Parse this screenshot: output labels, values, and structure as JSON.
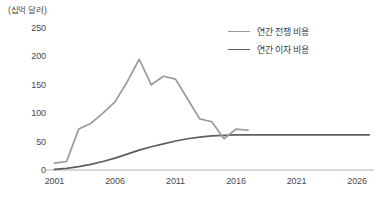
{
  "chart_data": {
    "type": "line",
    "title": "",
    "unit_label": "(십억 달러)",
    "xlabel": "",
    "ylabel": "",
    "xlim": [
      2000.3,
      2027.4
    ],
    "ylim": [
      0,
      250
    ],
    "grid": false,
    "legend_position": "top-right",
    "x_ticks": [
      "2001",
      "2006",
      "2011",
      "2016",
      "2021",
      "2026"
    ],
    "x_tick_values": [
      2001,
      2006,
      2011,
      2016,
      2021,
      2026
    ],
    "y_ticks": [
      "0",
      "50",
      "100",
      "150",
      "200",
      "250"
    ],
    "y_tick_values": [
      0,
      50,
      100,
      150,
      200,
      250
    ],
    "series": [
      {
        "name": "연간 전쟁 비용",
        "color": "#9a9a9a",
        "x": [
          2001,
          2002,
          2003,
          2004,
          2005,
          2006,
          2007,
          2008,
          2009,
          2010,
          2011,
          2012,
          2013,
          2014,
          2015,
          2016,
          2017
        ],
        "values": [
          12,
          15,
          72,
          82,
          100,
          120,
          155,
          195,
          150,
          165,
          160,
          125,
          90,
          85,
          55,
          72,
          70
        ]
      },
      {
        "name": "연간 이자 비용",
        "color": "#5e5e5e",
        "x": [
          2001,
          2002,
          2003,
          2004,
          2005,
          2006,
          2007,
          2008,
          2009,
          2010,
          2011,
          2012,
          2013,
          2014,
          2015,
          2016,
          2017,
          2018,
          2019,
          2020,
          2021,
          2022,
          2023,
          2024,
          2025,
          2026,
          2027
        ],
        "values": [
          1,
          3,
          6,
          10,
          15,
          21,
          28,
          35,
          41,
          46,
          51,
          55,
          58,
          60,
          61,
          62,
          62,
          62,
          62,
          62,
          62,
          62,
          62,
          62,
          62,
          62,
          62
        ]
      }
    ],
    "axis_color": "#b0b0b0"
  },
  "legend": {
    "items": [
      {
        "label": "연간 전쟁 비용",
        "color": "#9a9a9a"
      },
      {
        "label": "연간 이자 비용",
        "color": "#5e5e5e"
      }
    ]
  }
}
